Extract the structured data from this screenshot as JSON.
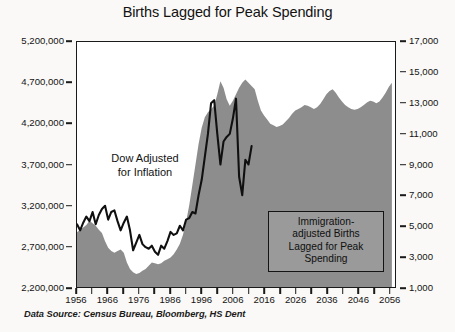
{
  "chart_data": {
    "type": "area",
    "title": "Births Lagged for Peak Spending",
    "xlabel": "",
    "ylabel": "",
    "grid": false,
    "legend_position": "none",
    "xlim": [
      1956,
      2058
    ],
    "x_tick_labels": [
      "1956",
      "1966",
      "1976",
      "1986",
      "1996",
      "2006",
      "2016",
      "2026",
      "2036",
      "2046",
      "2056"
    ],
    "x_tick_values": [
      1956,
      1966,
      1976,
      1986,
      1996,
      2006,
      2016,
      2026,
      2036,
      2046,
      2056
    ],
    "x_minor_tick_step": 5,
    "left_axis": {
      "label": "",
      "ylim": [
        2200000,
        5200000
      ],
      "tick_values": [
        2200000,
        2700000,
        3200000,
        3700000,
        4200000,
        4700000,
        5200000
      ],
      "tick_labels": [
        "2,200,000",
        "2,700,000",
        "3,200,000",
        "3,700,000",
        "4,200,000",
        "4,700,000",
        "5,200,000"
      ]
    },
    "right_axis": {
      "label": "",
      "ylim": [
        1000,
        17000
      ],
      "tick_values": [
        1000,
        3000,
        5000,
        7000,
        9000,
        11000,
        13000,
        15000,
        17000
      ],
      "tick_labels": [
        "1,000",
        "3,000",
        "5,000",
        "7,000",
        "9,000",
        "11,000",
        "13,000",
        "15,000",
        "17,000"
      ]
    },
    "series": [
      {
        "name": "Immigration-adjusted Births Lagged for Peak Spending",
        "type": "area",
        "axis": "left",
        "color": "#8d8d8d",
        "x": [
          1956,
          1957,
          1958,
          1959,
          1960,
          1961,
          1962,
          1963,
          1964,
          1965,
          1966,
          1967,
          1968,
          1969,
          1970,
          1971,
          1972,
          1973,
          1974,
          1975,
          1976,
          1977,
          1978,
          1979,
          1980,
          1981,
          1982,
          1983,
          1984,
          1985,
          1986,
          1987,
          1988,
          1989,
          1990,
          1991,
          1992,
          1993,
          1994,
          1995,
          1996,
          1997,
          1998,
          1999,
          2000,
          2001,
          2002,
          2003,
          2004,
          2005,
          2006,
          2007,
          2008,
          2009,
          2010,
          2011,
          2012,
          2013,
          2014,
          2015,
          2016,
          2017,
          2018,
          2019,
          2020,
          2021,
          2022,
          2023,
          2024,
          2025,
          2026,
          2027,
          2028,
          2029,
          2030,
          2031,
          2032,
          2033,
          2034,
          2035,
          2036,
          2037,
          2038,
          2039,
          2040,
          2041,
          2042,
          2043,
          2044,
          2045,
          2046,
          2047,
          2048,
          2049,
          2050,
          2051,
          2052,
          2053,
          2054,
          2055,
          2056,
          2057
        ],
        "values": [
          2870000,
          2900000,
          2930000,
          2960000,
          3010000,
          2980000,
          2950000,
          2900000,
          2860000,
          2760000,
          2680000,
          2640000,
          2620000,
          2640000,
          2660000,
          2620000,
          2500000,
          2420000,
          2380000,
          2360000,
          2370000,
          2400000,
          2420000,
          2460000,
          2500000,
          2490000,
          2480000,
          2490000,
          2520000,
          2540000,
          2560000,
          2600000,
          2660000,
          2730000,
          2840000,
          3000000,
          3200000,
          3450000,
          3700000,
          3950000,
          4150000,
          4280000,
          4340000,
          4380000,
          4420000,
          4560000,
          4720000,
          4640000,
          4500000,
          4420000,
          4480000,
          4560000,
          4640000,
          4700000,
          4740000,
          4700000,
          4660000,
          4620000,
          4480000,
          4360000,
          4300000,
          4250000,
          4200000,
          4180000,
          4160000,
          4170000,
          4190000,
          4230000,
          4270000,
          4320000,
          4360000,
          4380000,
          4400000,
          4430000,
          4420000,
          4400000,
          4380000,
          4400000,
          4440000,
          4500000,
          4560000,
          4600000,
          4620000,
          4580000,
          4520000,
          4470000,
          4430000,
          4400000,
          4380000,
          4370000,
          4380000,
          4400000,
          4430000,
          4460000,
          4480000,
          4470000,
          4450000,
          4470000,
          4520000,
          4580000,
          4650000,
          4700000
        ]
      },
      {
        "name": "Dow Adjusted for Inflation",
        "type": "line",
        "axis": "right",
        "color": "#101010",
        "x": [
          1956,
          1957,
          1958,
          1959,
          1960,
          1961,
          1962,
          1963,
          1964,
          1965,
          1966,
          1967,
          1968,
          1969,
          1970,
          1971,
          1972,
          1973,
          1974,
          1975,
          1976,
          1977,
          1978,
          1979,
          1980,
          1981,
          1982,
          1983,
          1984,
          1985,
          1986,
          1987,
          1988,
          1989,
          1990,
          1991,
          1992,
          1993,
          1994,
          1995,
          1996,
          1997,
          1998,
          1999,
          2000,
          2001,
          2002,
          2003,
          2004,
          2005,
          2006,
          2007,
          2008,
          2009,
          2010,
          2011,
          2012
        ],
        "values": [
          5100,
          4700,
          5200,
          5600,
          5300,
          5900,
          5100,
          5700,
          6100,
          6300,
          5400,
          5900,
          6000,
          5300,
          4700,
          5200,
          5600,
          4700,
          3400,
          3900,
          4400,
          3800,
          3600,
          3500,
          3700,
          3300,
          3100,
          3700,
          3500,
          4000,
          4600,
          4400,
          4500,
          5000,
          4700,
          5400,
          5500,
          5900,
          5800,
          7000,
          8000,
          9500,
          11000,
          13000,
          13200,
          11000,
          9000,
          10500,
          10800,
          11000,
          12000,
          13300,
          8200,
          7000,
          9300,
          9000,
          10200
        ]
      }
    ],
    "annotations": [
      {
        "name": "dow-label",
        "lines": [
          "Dow Adjusted",
          "for Inflation"
        ]
      },
      {
        "name": "births-label",
        "lines": [
          "Immigration-",
          "adjusted Births",
          "Lagged for Peak",
          "Spending"
        ]
      }
    ],
    "source_note": "Data Source: Census Bureau, Bloomberg, HS Dent"
  },
  "colors": {
    "area_gray": "#8d8d8d",
    "line_black": "#101010",
    "frame": "#1a1a1a",
    "background": "#faf9f7",
    "plot_background": "#ffffff",
    "box_fill": "#9a9a9a"
  }
}
